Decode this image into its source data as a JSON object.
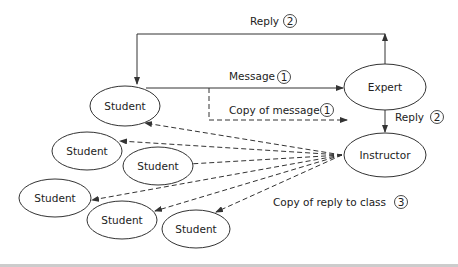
{
  "nodes": {
    "student_main": "Student",
    "expert": "Expert",
    "instructor": "Instructor",
    "students": [
      "Student",
      "Student",
      "Student",
      "Student",
      "Student"
    ]
  },
  "edges": {
    "reply_top": {
      "label": "Reply",
      "step": "2"
    },
    "message": {
      "label": "Message",
      "step": "1"
    },
    "copy_message": {
      "label": "Copy of message",
      "step": "1"
    },
    "reply_right": {
      "label": "Reply",
      "step": "2"
    },
    "copy_reply": {
      "label": "Copy of reply to class",
      "step": "3"
    }
  },
  "colors": {
    "line": "#333333",
    "text": "#222222",
    "footer": "#cccccc"
  }
}
